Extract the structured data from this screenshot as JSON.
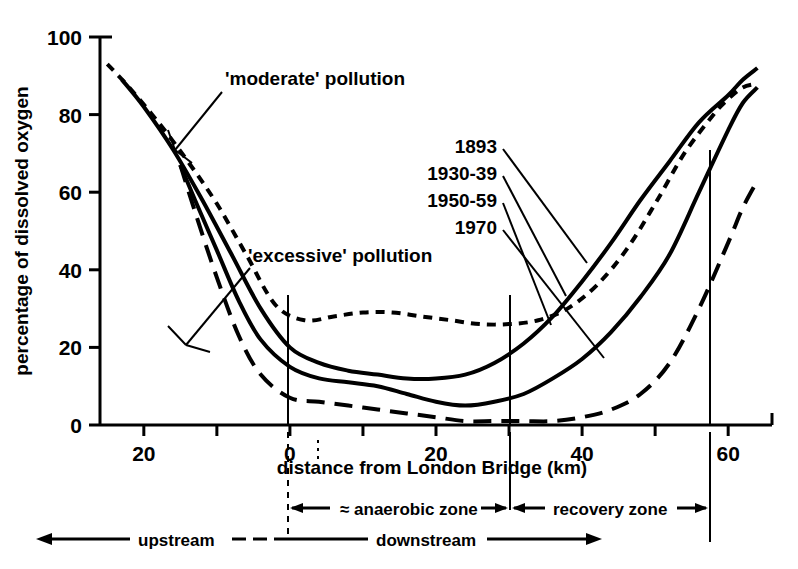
{
  "chart_data": {
    "type": "line",
    "title": "",
    "xlabel": "distance from London Bridge (km)",
    "ylabel": "percentage of dissolved oxygen",
    "xlim": [
      -26,
      66
    ],
    "ylim": [
      0,
      100
    ],
    "grid": false,
    "legend_position": "inside-upper-right",
    "xticks": [
      -20,
      -10,
      0,
      10,
      20,
      30,
      40,
      50,
      60
    ],
    "xtick_labels": [
      "20",
      "",
      "0",
      "",
      "20",
      "",
      "40",
      "",
      "60"
    ],
    "yticks": [
      0,
      20,
      40,
      60,
      80,
      100
    ],
    "ytick_labels": [
      "0",
      "20",
      "40",
      "60",
      "80",
      "100"
    ],
    "series": [
      {
        "name": "1893",
        "style": "short-dash",
        "x": [
          -25,
          -22,
          -18,
          -14,
          -10,
          -6,
          -2,
          2,
          6,
          10,
          14,
          18,
          22,
          26,
          30,
          34,
          38,
          42,
          46,
          50,
          54,
          58,
          60,
          62,
          64
        ],
        "values": [
          93,
          87,
          78,
          68,
          57,
          44,
          31,
          27,
          28,
          29,
          29,
          28,
          27,
          26,
          26,
          27,
          30,
          36,
          45,
          57,
          70,
          80,
          84,
          87,
          88
        ]
      },
      {
        "name": "1930-39",
        "style": "solid",
        "x": [
          -23,
          -20,
          -16,
          -12,
          -8,
          -4,
          0,
          4,
          8,
          12,
          16,
          20,
          24,
          28,
          32,
          36,
          40,
          44,
          48,
          52,
          56,
          60,
          62,
          64
        ],
        "values": [
          89,
          82,
          71,
          58,
          44,
          30,
          20,
          16,
          14,
          13,
          12,
          12,
          13,
          16,
          21,
          28,
          37,
          47,
          58,
          68,
          78,
          85,
          89,
          92
        ]
      },
      {
        "name": "1950-59",
        "style": "solid",
        "x": [
          -15,
          -13,
          -10,
          -7,
          -4,
          0,
          4,
          8,
          12,
          16,
          20,
          24,
          28,
          32,
          36,
          40,
          44,
          48,
          52,
          56,
          60,
          62,
          64
        ],
        "values": [
          67,
          58,
          45,
          32,
          22,
          15,
          12,
          11,
          10,
          8,
          6,
          5,
          6,
          8,
          12,
          17,
          24,
          33,
          44,
          60,
          76,
          83,
          87
        ]
      },
      {
        "name": "1970",
        "style": "long-dash",
        "x": [
          -15,
          -13,
          -10,
          -7,
          -4,
          0,
          4,
          8,
          12,
          16,
          20,
          24,
          28,
          32,
          36,
          40,
          44,
          48,
          52,
          56,
          60,
          62,
          64
        ],
        "values": [
          67,
          55,
          38,
          23,
          13,
          7,
          6,
          5,
          4,
          3,
          2,
          1,
          1,
          1,
          1,
          2,
          4,
          8,
          16,
          30,
          47,
          56,
          63
        ]
      }
    ],
    "annotations": [
      {
        "name": "moderate-pollution",
        "text": "'moderate' pollution"
      },
      {
        "name": "excessive-pollution",
        "text": "'excessive' pollution"
      }
    ],
    "zones": [
      {
        "name": "upstream",
        "label": "upstream",
        "from": -26,
        "to": -3
      },
      {
        "name": "downstream",
        "label": "downstream",
        "from": -3,
        "to": 40
      },
      {
        "name": "anaerobic-zone",
        "label": "≈ anaerobic zone",
        "from": -3,
        "to": 30
      },
      {
        "name": "recovery-zone",
        "label": "recovery zone",
        "from": 30,
        "to": 60
      }
    ]
  },
  "legend": {
    "entries": [
      {
        "label": "1893"
      },
      {
        "label": "1930-39"
      },
      {
        "label": "1950-59"
      },
      {
        "label": "1970"
      }
    ]
  },
  "axes": {
    "y_title": "percentage of dissolved oxygen",
    "x_title": "distance from London Bridge (km)",
    "y_ticks": [
      "100",
      "80",
      "60",
      "40",
      "20",
      "0"
    ],
    "x_ticks": [
      "20",
      "0",
      "20",
      "40",
      "60"
    ]
  },
  "annotations": {
    "moderate": "'moderate' pollution",
    "excessive": "'excessive' pollution"
  },
  "zones": {
    "upstream": "upstream",
    "downstream": "downstream",
    "anaerobic": "≈ anaerobic zone",
    "recovery": "recovery zone"
  },
  "colors": {
    "ink": "#000000",
    "background": "#ffffff"
  }
}
